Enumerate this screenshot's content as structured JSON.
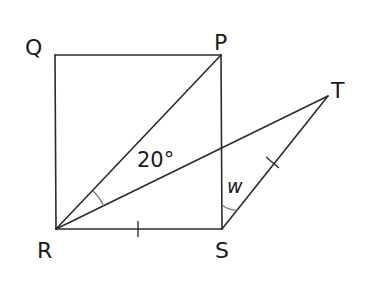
{
  "figure": {
    "type": "geometry",
    "vertices": [
      "Q",
      "P",
      "R",
      "S",
      "T"
    ],
    "labels": {
      "Q": "Q",
      "P": "P",
      "R": "R",
      "S": "S",
      "T": "T"
    },
    "angles": {
      "PRT": "20°",
      "PST": "w"
    },
    "segments": [
      "QP",
      "QR",
      "PS",
      "RS",
      "RP",
      "RT",
      "ST"
    ],
    "equal_marks": [
      "RS",
      "ST"
    ],
    "colors": {
      "line": "#2b2b2b",
      "arc": "#777777",
      "text": "#1a1a1a"
    }
  }
}
